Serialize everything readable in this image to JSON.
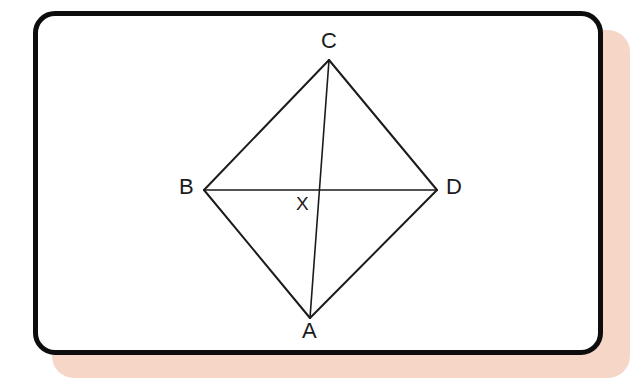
{
  "figure": {
    "type": "geometry-diagram",
    "card": {
      "background_color": "#ffffff",
      "border_color": "#0d0d0d",
      "border_width_px": 5,
      "corner_radius_px": 22,
      "shadow_color": "#f6d6c7"
    },
    "stroke_color": "#1b1b1b",
    "stroke_width_px": 2,
    "points": [
      {
        "name": "C",
        "label": "C",
        "x": 329,
        "y": 60,
        "label_x": 321,
        "label_y": 30
      },
      {
        "name": "B",
        "label": "B",
        "x": 204,
        "y": 190,
        "label_x": 179,
        "label_y": 176
      },
      {
        "name": "D",
        "label": "D",
        "x": 437,
        "y": 190,
        "label_x": 446,
        "label_y": 176
      },
      {
        "name": "A",
        "label": "A",
        "x": 310,
        "y": 318,
        "label_x": 302,
        "label_y": 320
      },
      {
        "name": "X",
        "label": "X",
        "x": 318,
        "y": 190,
        "label_x": 296,
        "label_y": 194
      }
    ],
    "segments": [
      {
        "name": "side-BC",
        "from": "B",
        "to": "C"
      },
      {
        "name": "side-CD",
        "from": "C",
        "to": "D"
      },
      {
        "name": "side-DA",
        "from": "D",
        "to": "A"
      },
      {
        "name": "side-AB",
        "from": "A",
        "to": "B"
      },
      {
        "name": "diagonal-BD",
        "from": "B",
        "to": "D"
      },
      {
        "name": "diagonal-CA",
        "from": "C",
        "to": "A"
      }
    ]
  }
}
